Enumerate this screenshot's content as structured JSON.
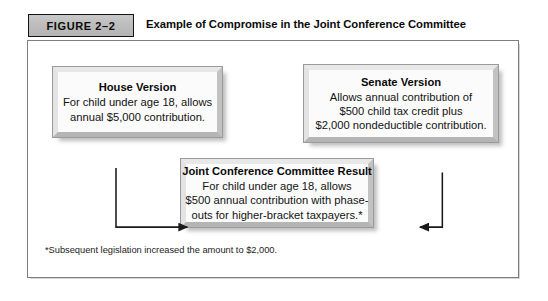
{
  "figure": {
    "label": "FIGURE 2–2",
    "title": "Example of Compromise in the Joint Conference Committee",
    "footnote": "*Subsequent legislation increased the amount to $2,000.",
    "label_fill_color": "#bdbdbd",
    "label_border_color": "#141414",
    "frame_border_color": "#7d7d84",
    "box_face_color": "#fbfbfb"
  },
  "nodes": {
    "house": {
      "title": "House Version",
      "lines": [
        "For child under age 18, allows",
        "annual $5,000 contribution."
      ]
    },
    "senate": {
      "title": "Senate Version",
      "lines": [
        "Allows annual contribution of",
        "$500 child tax credit plus",
        "$2,000 nondeductible contribution."
      ]
    },
    "joint": {
      "title": "Joint Conference Committee Result",
      "lines": [
        "For child under age 18, allows",
        "$500 annual contribution with phase-",
        "outs for higher-bracket taxpayers.*"
      ]
    }
  },
  "connectors": [
    {
      "name": "house-to-joint",
      "from": "house",
      "to": "joint",
      "direction": "down-then-right"
    },
    {
      "name": "senate-to-joint",
      "from": "senate",
      "to": "joint",
      "direction": "down-then-left"
    }
  ]
}
